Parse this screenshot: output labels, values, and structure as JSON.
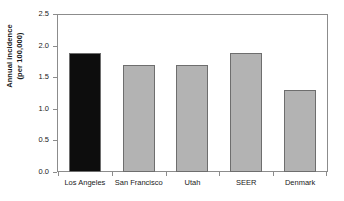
{
  "chart_data": {
    "type": "bar",
    "title": "",
    "xlabel": "",
    "ylabel": "Annual incidence\n(per 100,000)",
    "ylabel_line1": "Annual incidence",
    "ylabel_line2": "(per 100,000)",
    "categories": [
      "Los Angeles",
      "San Francisco",
      "Utah",
      "SEER",
      "Denmark"
    ],
    "values": [
      1.9,
      1.7,
      1.7,
      1.9,
      1.3
    ],
    "ylim": [
      0.0,
      2.5
    ],
    "ytick_labels": [
      "0.0",
      "0.5",
      "1.0",
      "1.5",
      "2.0",
      "2.5"
    ],
    "ytick_values": [
      0.0,
      0.5,
      1.0,
      1.5,
      2.0,
      2.5
    ],
    "grid": false,
    "legend": "none",
    "bar_colors": [
      "#0d0d0d",
      "#b3b3b3",
      "#b3b3b3",
      "#b3b3b3",
      "#b3b3b3"
    ],
    "bar_border_color": "#6e6e6e",
    "axis_color": "#8c8c8c",
    "background_color": "#ffffff",
    "highlight_category": "Los Angeles"
  }
}
